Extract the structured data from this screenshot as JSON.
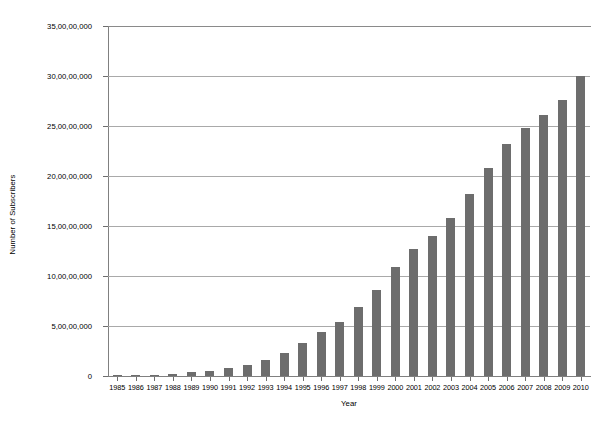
{
  "chart_data": {
    "type": "bar",
    "title": "",
    "xlabel": "Year",
    "ylabel": "Number of Subscribers",
    "grid": true,
    "legend": "none",
    "orientation": "vertical",
    "bar_color": "#6d6d6d",
    "axis_color": "#808080",
    "gridline_color": "#a9a9a9",
    "xlim": [
      "1985",
      "2010"
    ],
    "ylim": [
      0,
      350000000
    ],
    "ytick_values": [
      0,
      50000000,
      100000000,
      150000000,
      200000000,
      250000000,
      300000000,
      350000000
    ],
    "ytick_labels": [
      "0",
      "5,00,00,000",
      "10,00,00,000",
      "15,00,00,000",
      "20,00,00,000",
      "25,00,00,000",
      "30,00,00,000",
      "35,00,00,000"
    ],
    "categories": [
      "1985",
      "1986",
      "1987",
      "1988",
      "1989",
      "1990",
      "1991",
      "1992",
      "1993",
      "1994",
      "1995",
      "1996",
      "1997",
      "1998",
      "1999",
      "2000",
      "2001",
      "2002",
      "2003",
      "2004",
      "2005",
      "2006",
      "2007",
      "2008",
      "2009",
      "2010"
    ],
    "values": [
      340000,
      680000,
      1230000,
      2070000,
      3620000,
      5290000,
      7630000,
      11030000,
      16000000,
      23000000,
      33000000,
      44000000,
      54000000,
      69000000,
      86000000,
      109000000,
      127000000,
      140000000,
      158000000,
      182000000,
      208000000,
      232000000,
      248000000,
      261000000,
      276000000,
      300000000
    ],
    "series": [
      {
        "name": "Number of Subscribers",
        "values": [
          340000,
          680000,
          1230000,
          2070000,
          3620000,
          5290000,
          7630000,
          11030000,
          16000000,
          23000000,
          33000000,
          44000000,
          54000000,
          69000000,
          86000000,
          109000000,
          127000000,
          140000000,
          158000000,
          182000000,
          208000000,
          232000000,
          248000000,
          261000000,
          276000000,
          300000000
        ]
      }
    ]
  }
}
